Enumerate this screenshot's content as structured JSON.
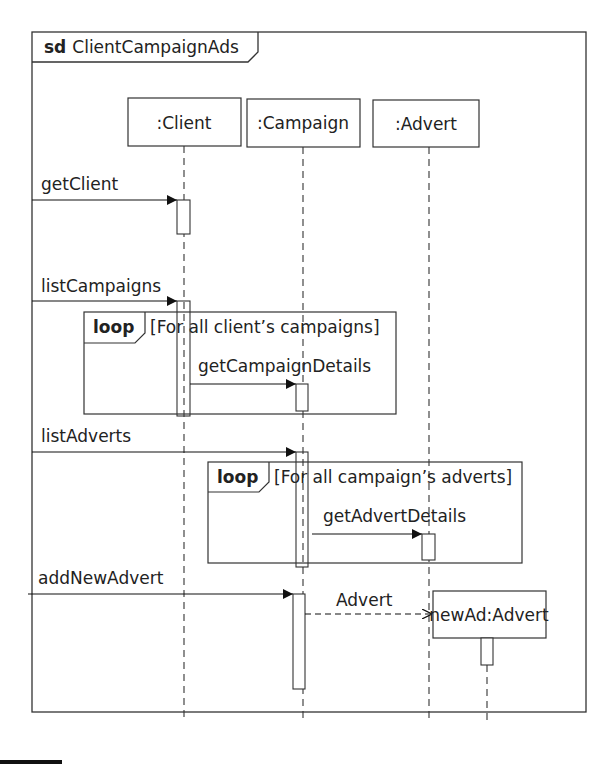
{
  "frame": {
    "keyword": "sd",
    "name": "ClientCampaignAds"
  },
  "lifelines": [
    {
      "label": ":Client"
    },
    {
      "label": ":Campaign"
    },
    {
      "label": ":Advert"
    },
    {
      "label": "newAd:Advert"
    }
  ],
  "messages": [
    {
      "label": "getClient",
      "type": "sync"
    },
    {
      "label": "listCampaigns",
      "type": "sync"
    },
    {
      "label": "getCampaignDetails",
      "type": "sync"
    },
    {
      "label": "listAdverts",
      "type": "sync"
    },
    {
      "label": "getAdvertDetails",
      "type": "sync"
    },
    {
      "label": "addNewAdvert",
      "type": "sync"
    },
    {
      "label": "Advert",
      "type": "create"
    }
  ],
  "fragments": [
    {
      "operator": "loop",
      "guard": "[For all client’s campaigns]"
    },
    {
      "operator": "loop",
      "guard": "[For all campaign’s adverts]"
    }
  ]
}
